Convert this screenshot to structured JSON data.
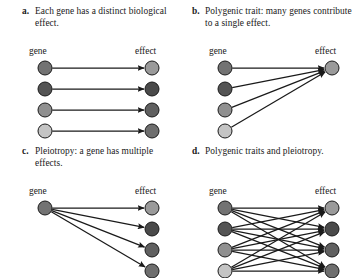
{
  "figure": {
    "background": "#ffffff",
    "node_stroke": "#1a1a1a",
    "edge_color": "#1a1a1a"
  },
  "panels": [
    {
      "id": "a",
      "letter": "a.",
      "caption": "Each gene has a distinct biological effect.",
      "gene_label": "gene",
      "effect_label": "effect",
      "genes": [
        {
          "index": 1,
          "color": "#737373"
        },
        {
          "index": 2,
          "color": "#545454"
        },
        {
          "index": 3,
          "color": "#909090"
        },
        {
          "index": 4,
          "color": "#c4c4c4"
        }
      ],
      "effects": [
        {
          "index": 1,
          "color": "#9a9a9a"
        },
        {
          "index": 2,
          "color": "#4a4a4a"
        },
        {
          "index": 3,
          "color": "#606060"
        },
        {
          "index": 4,
          "color": "#6e6e6e"
        }
      ],
      "edges": [
        [
          1,
          1
        ],
        [
          2,
          2
        ],
        [
          3,
          3
        ],
        [
          4,
          4
        ]
      ],
      "edge_count": 4,
      "pattern": "one-to-one"
    },
    {
      "id": "b",
      "letter": "b.",
      "caption": "Polygenic trait: many genes contribute to a single effect.",
      "gene_label": "gene",
      "effect_label": "effect",
      "genes": [
        {
          "index": 1,
          "color": "#737373"
        },
        {
          "index": 2,
          "color": "#545454"
        },
        {
          "index": 3,
          "color": "#909090"
        },
        {
          "index": 4,
          "color": "#c4c4c4"
        }
      ],
      "effects": [
        {
          "index": 1,
          "color": "#9a9a9a"
        }
      ],
      "edges": [
        [
          1,
          1
        ],
        [
          2,
          1
        ],
        [
          3,
          1
        ],
        [
          4,
          1
        ]
      ],
      "edge_count": 4,
      "pattern": "many-to-one"
    },
    {
      "id": "c",
      "letter": "c.",
      "caption": "Pleiotropy: a gene has multiple effects.",
      "gene_label": "gene",
      "effect_label": "effect",
      "genes": [
        {
          "index": 1,
          "color": "#737373"
        }
      ],
      "effects": [
        {
          "index": 1,
          "color": "#9a9a9a"
        },
        {
          "index": 2,
          "color": "#4a4a4a"
        },
        {
          "index": 3,
          "color": "#606060"
        },
        {
          "index": 4,
          "color": "#6e6e6e"
        }
      ],
      "edges": [
        [
          1,
          1
        ],
        [
          1,
          2
        ],
        [
          1,
          3
        ],
        [
          1,
          4
        ]
      ],
      "edge_count": 4,
      "pattern": "one-to-many"
    },
    {
      "id": "d",
      "letter": "d.",
      "caption": "Polygenic traits and pleiotropy.",
      "gene_label": "gene",
      "effect_label": "effect",
      "genes": [
        {
          "index": 1,
          "color": "#737373"
        },
        {
          "index": 2,
          "color": "#545454"
        },
        {
          "index": 3,
          "color": "#909090"
        },
        {
          "index": 4,
          "color": "#c4c4c4"
        }
      ],
      "effects": [
        {
          "index": 1,
          "color": "#9a9a9a"
        },
        {
          "index": 2,
          "color": "#4a4a4a"
        },
        {
          "index": 3,
          "color": "#606060"
        },
        {
          "index": 4,
          "color": "#6e6e6e"
        }
      ],
      "edges": [
        [
          1,
          1
        ],
        [
          1,
          2
        ],
        [
          1,
          3
        ],
        [
          1,
          4
        ],
        [
          2,
          1
        ],
        [
          2,
          2
        ],
        [
          2,
          3
        ],
        [
          2,
          4
        ],
        [
          3,
          1
        ],
        [
          3,
          2
        ],
        [
          3,
          3
        ],
        [
          3,
          4
        ],
        [
          4,
          1
        ],
        [
          4,
          2
        ],
        [
          4,
          3
        ],
        [
          4,
          4
        ]
      ],
      "edge_count": 16,
      "pattern": "many-to-many"
    }
  ]
}
